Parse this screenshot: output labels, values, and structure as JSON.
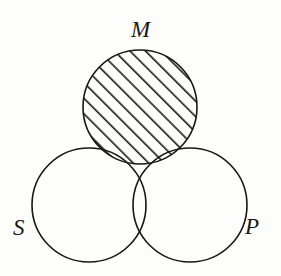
{
  "figure": {
    "type": "venn-diagram",
    "subtype": "categorical-syllogism-venn",
    "width": 281,
    "height": 276,
    "background_color": "#fdfdfb",
    "stroke_color": "#191713",
    "stroke_width": 1.6
  },
  "labels": {
    "m": "M",
    "s": "S",
    "p": "P"
  },
  "circles": [
    {
      "id": "M",
      "label": "M",
      "cx": 140,
      "cy": 107,
      "r": 57,
      "position": "top"
    },
    {
      "id": "S",
      "label": "S",
      "cx": 89,
      "cy": 205,
      "r": 57,
      "position": "bottom-left"
    },
    {
      "id": "P",
      "label": "P",
      "cx": 190,
      "cy": 205,
      "r": 57,
      "position": "bottom-right"
    }
  ],
  "label_positions": [
    {
      "id": "M",
      "x": 142,
      "y": 32,
      "anchor": "middle"
    },
    {
      "id": "S",
      "x": 21,
      "y": 230,
      "anchor": "middle"
    },
    {
      "id": "P",
      "x": 253,
      "y": 229,
      "anchor": "middle"
    }
  ],
  "regions": [
    {
      "id": "M-only",
      "description": "M not S not P",
      "shading": "diagonal-hatch"
    },
    {
      "id": "M-and-S",
      "description": "M and S not P",
      "shading": "diagonal-hatch"
    },
    {
      "id": "M-and-P",
      "description": "M and P not S",
      "shading": "cross-hatch"
    },
    {
      "id": "M-S-P",
      "description": "M and S and P",
      "shading": "cross-hatch"
    },
    {
      "id": "S-only",
      "description": "S not M not P",
      "shading": "none"
    },
    {
      "id": "P-only",
      "description": "P not M not S",
      "shading": "none"
    },
    {
      "id": "S-and-P",
      "description": "S and P not M",
      "shading": "none"
    }
  ],
  "patterns": {
    "diagonal_hatch": {
      "name": "diagonal-hatch",
      "angle_deg": -45,
      "spacing": 11,
      "line_width": 3.2,
      "color": "#191713"
    },
    "cross_hatch": {
      "name": "cross-hatch",
      "angles_deg": [
        -45,
        45
      ],
      "spacing": 11,
      "line_width": 3.2,
      "color": "#191713"
    }
  }
}
